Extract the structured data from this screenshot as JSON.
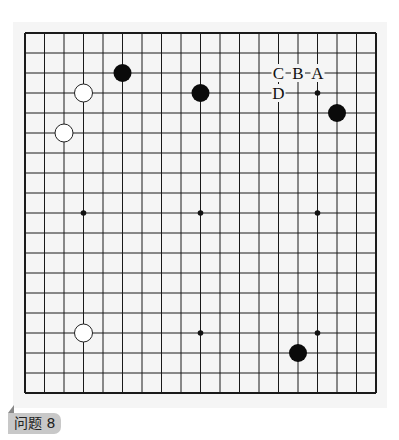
{
  "problem": {
    "label": "问题 8"
  },
  "board": {
    "size": 19,
    "origin_x": 25,
    "origin_y": 33,
    "spacing_x": 19.5,
    "spacing_y": 20,
    "line_color": "#1a1a1a",
    "black_stones": [
      [
        5,
        2
      ],
      [
        9,
        3
      ],
      [
        16,
        4
      ],
      [
        14,
        16
      ]
    ],
    "white_stones": [
      [
        3,
        3
      ],
      [
        2,
        5
      ],
      [
        3,
        15
      ]
    ],
    "star_points": [
      [
        15,
        3
      ],
      [
        3,
        9
      ],
      [
        9,
        9
      ],
      [
        15,
        9
      ],
      [
        9,
        15
      ],
      [
        15,
        15
      ]
    ],
    "marks": [
      {
        "label": "C",
        "col": 13,
        "row": 2
      },
      {
        "label": "B",
        "col": 14,
        "row": 2
      },
      {
        "label": "A",
        "col": 15,
        "row": 2
      },
      {
        "label": "D",
        "col": 13,
        "row": 3
      }
    ]
  }
}
